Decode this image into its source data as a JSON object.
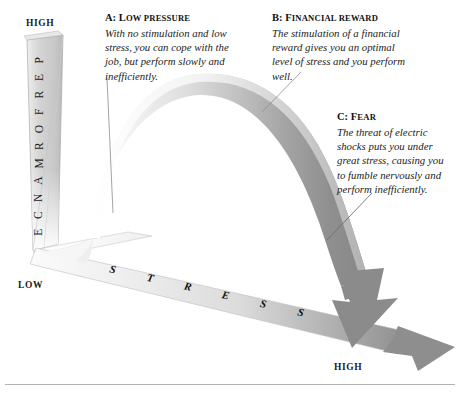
{
  "figure": {
    "type": "annotated-diagram"
  },
  "axes": {
    "vertical": {
      "name": "PERFORMANCE",
      "letters": [
        "P",
        "E",
        "R",
        "F",
        "O",
        "R",
        "M",
        "A",
        "N",
        "C",
        "E"
      ],
      "high_label": "HIGH",
      "low_label": "LOW"
    },
    "horizontal": {
      "name": "STRESS",
      "letters": [
        "S",
        "T",
        "R",
        "E",
        "S",
        "S"
      ],
      "high_label": "HIGH"
    }
  },
  "annotations": [
    {
      "id": "a",
      "marker": "A:",
      "title": "Low pressure",
      "body": "With no stimulation and low stress, you can cope with the job, but perform slowly and inefficiently."
    },
    {
      "id": "b",
      "marker": "B:",
      "title": "Financial reward",
      "body": "The stimulation of a financial reward gives you an optimal level of stress and you perform well."
    },
    {
      "id": "c",
      "marker": "C:",
      "title": "Fear",
      "body": "The threat of electric shocks puts you under great stress, causing you to fumble nervously and perform inefficiently."
    }
  ],
  "chart_data": {
    "type": "line",
    "title": "",
    "xlabel": "STRESS",
    "ylabel": "PERFORMANCE",
    "xlim": [
      0,
      100
    ],
    "ylim": [
      0,
      100
    ],
    "grid": false,
    "x": [
      0,
      10,
      20,
      30,
      40,
      50,
      60,
      70,
      80,
      90,
      100
    ],
    "values": [
      5,
      22,
      45,
      66,
      81,
      90,
      88,
      76,
      56,
      32,
      10
    ],
    "annotated_points": [
      {
        "label": "A",
        "x": 12,
        "y": 26
      },
      {
        "label": "B",
        "x": 52,
        "y": 90
      },
      {
        "label": "C",
        "x": 88,
        "y": 22
      }
    ],
    "legend": null
  },
  "colors": {
    "ribbon_light": "#f0f0f0",
    "ribbon_mid": "#bdbdbd",
    "ribbon_dark": "#8b8b8b",
    "axis_face": "#d8d8d8",
    "outline": "#9a9a9a",
    "text": "#1b1b1b",
    "rule": "#b2b2b2",
    "leader": "#8d8d8d"
  }
}
